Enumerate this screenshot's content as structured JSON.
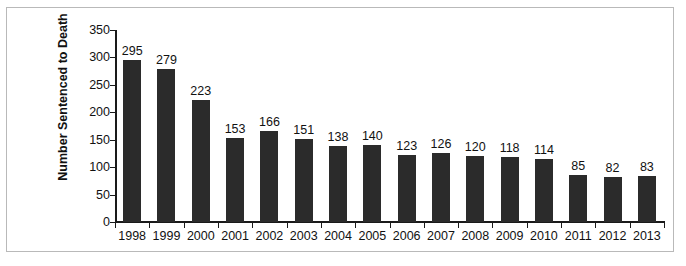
{
  "chart_data": {
    "type": "bar",
    "title": "",
    "xlabel": "",
    "ylabel": "Number Sentenced to Death",
    "categories": [
      "1998",
      "1999",
      "2000",
      "2001",
      "2002",
      "2003",
      "2004",
      "2005",
      "2006",
      "2007",
      "2008",
      "2009",
      "2010",
      "2011",
      "2012",
      "2013"
    ],
    "values": [
      295,
      279,
      223,
      153,
      166,
      151,
      138,
      140,
      123,
      126,
      120,
      118,
      114,
      85,
      82,
      83
    ],
    "ylim": [
      0,
      350
    ],
    "yticks": [
      0,
      50,
      100,
      150,
      200,
      250,
      300,
      350
    ],
    "ytick_labels": [
      "0",
      "50",
      "100",
      "150",
      "200",
      "250",
      "300",
      "350"
    ],
    "grid": false,
    "legend": false,
    "data_labels": true,
    "colors": {
      "bar": "#2b2b2b",
      "axis": "#1a1a1a",
      "text": "#111111",
      "frame": "#b9b9b9",
      "background": "#ffffff"
    }
  }
}
